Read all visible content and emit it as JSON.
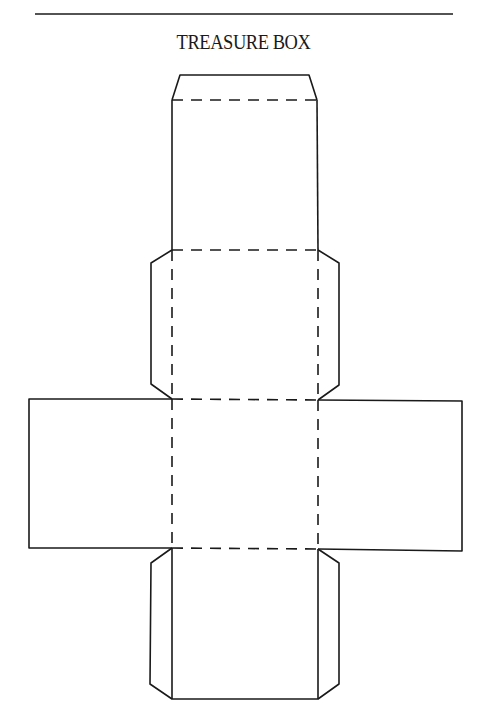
{
  "title": "TREASURE BOX",
  "diagram": {
    "type": "box-net-template",
    "ink_color": "#1a1a1a",
    "background": "#ffffff",
    "line_styles": {
      "cut": "solid",
      "fold": "dashed"
    },
    "panels": [
      {
        "name": "top-tuck-flap",
        "kind": "flap"
      },
      {
        "name": "lid-panel",
        "kind": "face"
      },
      {
        "name": "upper-face",
        "kind": "face"
      },
      {
        "name": "left-face",
        "kind": "face"
      },
      {
        "name": "center-face",
        "kind": "face"
      },
      {
        "name": "right-face",
        "kind": "face"
      },
      {
        "name": "bottom-face",
        "kind": "face"
      },
      {
        "name": "upper-left-dust-flap",
        "kind": "flap"
      },
      {
        "name": "upper-right-dust-flap",
        "kind": "flap"
      },
      {
        "name": "lower-left-dust-flap",
        "kind": "flap"
      },
      {
        "name": "lower-right-dust-flap",
        "kind": "flap"
      }
    ]
  }
}
